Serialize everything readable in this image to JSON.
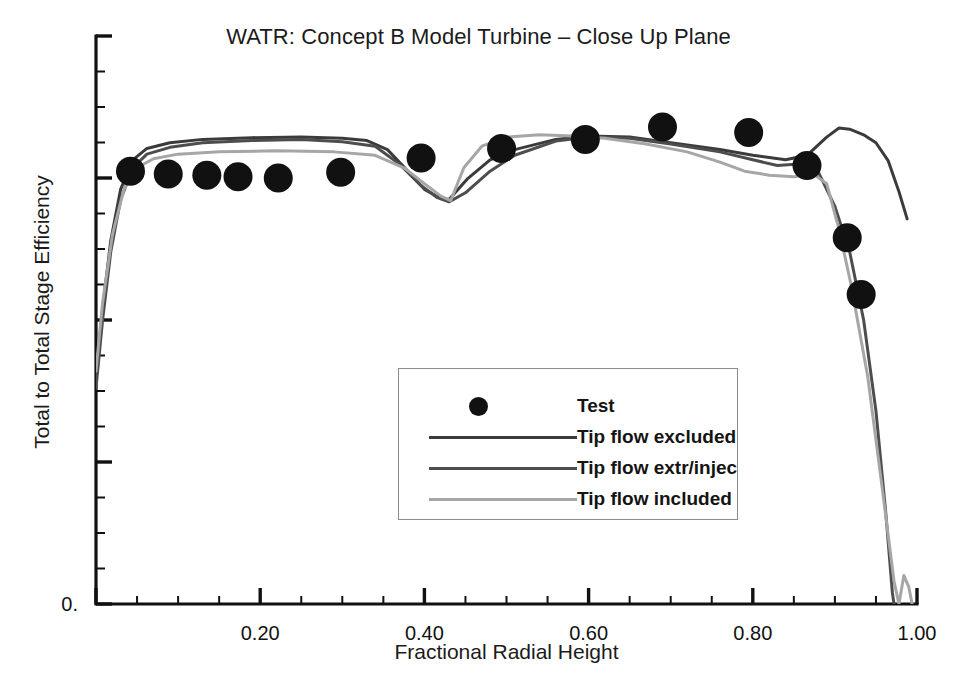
{
  "chart_data": {
    "type": "line",
    "title": "WATR: Concept B Model Turbine – Close Up Plane",
    "xlabel": "Fractional Radial Height",
    "ylabel": "Total to Total Stage Efficiency",
    "xlim": [
      0.0,
      1.0
    ],
    "ylim": [
      0.0,
      1.0
    ],
    "grid": false,
    "legend_position": "center",
    "xticks": [
      0.0,
      0.2,
      0.4,
      0.6,
      0.8,
      1.0
    ],
    "xtick_labels": [
      "",
      "0.20",
      "0.40",
      "0.60",
      "0.80",
      "1.00"
    ],
    "xminor_step": 0.05,
    "yticks": [
      0.0,
      0.25,
      0.5,
      0.75,
      1.0
    ],
    "ytick_labels": [
      "0.",
      "",
      "",
      "",
      ""
    ],
    "yminor_step": 0.0625,
    "series": [
      {
        "name": "Test",
        "type": "scatter",
        "marker": "circle",
        "color": "#111111",
        "points": [
          {
            "x": 0.042,
            "y": 0.762
          },
          {
            "x": 0.088,
            "y": 0.757
          },
          {
            "x": 0.135,
            "y": 0.755
          },
          {
            "x": 0.173,
            "y": 0.752
          },
          {
            "x": 0.222,
            "y": 0.75
          },
          {
            "x": 0.298,
            "y": 0.76
          },
          {
            "x": 0.396,
            "y": 0.785
          },
          {
            "x": 0.494,
            "y": 0.802
          },
          {
            "x": 0.596,
            "y": 0.818
          },
          {
            "x": 0.69,
            "y": 0.84
          },
          {
            "x": 0.795,
            "y": 0.83
          },
          {
            "x": 0.866,
            "y": 0.772
          },
          {
            "x": 0.915,
            "y": 0.645
          },
          {
            "x": 0.932,
            "y": 0.545
          }
        ]
      },
      {
        "name": "Tip flow excluded",
        "type": "line",
        "color": "#3b3b3b",
        "width": 3.0,
        "points": [
          {
            "x": 0.0,
            "y": 0.4
          },
          {
            "x": 0.008,
            "y": 0.52
          },
          {
            "x": 0.018,
            "y": 0.64
          },
          {
            "x": 0.03,
            "y": 0.73
          },
          {
            "x": 0.045,
            "y": 0.782
          },
          {
            "x": 0.062,
            "y": 0.802
          },
          {
            "x": 0.09,
            "y": 0.812
          },
          {
            "x": 0.13,
            "y": 0.818
          },
          {
            "x": 0.19,
            "y": 0.821
          },
          {
            "x": 0.25,
            "y": 0.822
          },
          {
            "x": 0.3,
            "y": 0.82
          },
          {
            "x": 0.33,
            "y": 0.816
          },
          {
            "x": 0.355,
            "y": 0.8
          },
          {
            "x": 0.38,
            "y": 0.762
          },
          {
            "x": 0.4,
            "y": 0.73
          },
          {
            "x": 0.42,
            "y": 0.714
          },
          {
            "x": 0.43,
            "y": 0.712
          },
          {
            "x": 0.452,
            "y": 0.748
          },
          {
            "x": 0.48,
            "y": 0.782
          },
          {
            "x": 0.51,
            "y": 0.8
          },
          {
            "x": 0.56,
            "y": 0.818
          },
          {
            "x": 0.6,
            "y": 0.824
          },
          {
            "x": 0.65,
            "y": 0.822
          },
          {
            "x": 0.7,
            "y": 0.812
          },
          {
            "x": 0.76,
            "y": 0.8
          },
          {
            "x": 0.8,
            "y": 0.79
          },
          {
            "x": 0.84,
            "y": 0.782
          },
          {
            "x": 0.866,
            "y": 0.79
          },
          {
            "x": 0.89,
            "y": 0.822
          },
          {
            "x": 0.905,
            "y": 0.838
          },
          {
            "x": 0.918,
            "y": 0.836
          },
          {
            "x": 0.935,
            "y": 0.826
          },
          {
            "x": 0.95,
            "y": 0.812
          },
          {
            "x": 0.965,
            "y": 0.78
          },
          {
            "x": 0.978,
            "y": 0.726
          },
          {
            "x": 0.988,
            "y": 0.678
          }
        ]
      },
      {
        "name": "Tip flow extr/injec",
        "type": "line",
        "color": "#4d4d4d",
        "width": 3.0,
        "points": [
          {
            "x": 0.0,
            "y": 0.38
          },
          {
            "x": 0.008,
            "y": 0.5
          },
          {
            "x": 0.018,
            "y": 0.62
          },
          {
            "x": 0.03,
            "y": 0.712
          },
          {
            "x": 0.045,
            "y": 0.768
          },
          {
            "x": 0.062,
            "y": 0.792
          },
          {
            "x": 0.09,
            "y": 0.804
          },
          {
            "x": 0.13,
            "y": 0.812
          },
          {
            "x": 0.19,
            "y": 0.816
          },
          {
            "x": 0.25,
            "y": 0.818
          },
          {
            "x": 0.3,
            "y": 0.814
          },
          {
            "x": 0.34,
            "y": 0.806
          },
          {
            "x": 0.37,
            "y": 0.774
          },
          {
            "x": 0.395,
            "y": 0.738
          },
          {
            "x": 0.415,
            "y": 0.716
          },
          {
            "x": 0.43,
            "y": 0.708
          },
          {
            "x": 0.45,
            "y": 0.724
          },
          {
            "x": 0.48,
            "y": 0.762
          },
          {
            "x": 0.51,
            "y": 0.79
          },
          {
            "x": 0.56,
            "y": 0.815
          },
          {
            "x": 0.6,
            "y": 0.822
          },
          {
            "x": 0.65,
            "y": 0.82
          },
          {
            "x": 0.7,
            "y": 0.81
          },
          {
            "x": 0.76,
            "y": 0.796
          },
          {
            "x": 0.8,
            "y": 0.782
          },
          {
            "x": 0.83,
            "y": 0.772
          },
          {
            "x": 0.86,
            "y": 0.775
          },
          {
            "x": 0.88,
            "y": 0.76
          },
          {
            "x": 0.9,
            "y": 0.7
          },
          {
            "x": 0.918,
            "y": 0.62
          },
          {
            "x": 0.935,
            "y": 0.5
          },
          {
            "x": 0.95,
            "y": 0.34
          },
          {
            "x": 0.962,
            "y": 0.16
          },
          {
            "x": 0.97,
            "y": 0.02
          },
          {
            "x": 0.972,
            "y": 0.0
          }
        ]
      },
      {
        "name": "Tip flow included",
        "type": "line",
        "color": "#a6a6a6",
        "width": 3.0,
        "points": [
          {
            "x": 0.0,
            "y": 0.41
          },
          {
            "x": 0.008,
            "y": 0.53
          },
          {
            "x": 0.02,
            "y": 0.65
          },
          {
            "x": 0.034,
            "y": 0.73
          },
          {
            "x": 0.05,
            "y": 0.768
          },
          {
            "x": 0.07,
            "y": 0.784
          },
          {
            "x": 0.1,
            "y": 0.792
          },
          {
            "x": 0.15,
            "y": 0.796
          },
          {
            "x": 0.22,
            "y": 0.798
          },
          {
            "x": 0.29,
            "y": 0.796
          },
          {
            "x": 0.34,
            "y": 0.79
          },
          {
            "x": 0.375,
            "y": 0.768
          },
          {
            "x": 0.4,
            "y": 0.74
          },
          {
            "x": 0.42,
            "y": 0.718
          },
          {
            "x": 0.432,
            "y": 0.71
          },
          {
            "x": 0.448,
            "y": 0.768
          },
          {
            "x": 0.47,
            "y": 0.806
          },
          {
            "x": 0.5,
            "y": 0.822
          },
          {
            "x": 0.54,
            "y": 0.826
          },
          {
            "x": 0.58,
            "y": 0.824
          },
          {
            "x": 0.62,
            "y": 0.82
          },
          {
            "x": 0.67,
            "y": 0.81
          },
          {
            "x": 0.72,
            "y": 0.796
          },
          {
            "x": 0.76,
            "y": 0.778
          },
          {
            "x": 0.79,
            "y": 0.762
          },
          {
            "x": 0.82,
            "y": 0.755
          },
          {
            "x": 0.85,
            "y": 0.752
          },
          {
            "x": 0.875,
            "y": 0.756
          },
          {
            "x": 0.89,
            "y": 0.74
          },
          {
            "x": 0.905,
            "y": 0.66
          },
          {
            "x": 0.92,
            "y": 0.56
          },
          {
            "x": 0.94,
            "y": 0.4
          },
          {
            "x": 0.958,
            "y": 0.2
          },
          {
            "x": 0.972,
            "y": 0.04
          },
          {
            "x": 0.978,
            "y": 0.0
          },
          {
            "x": 0.984,
            "y": 0.05
          },
          {
            "x": 0.99,
            "y": 0.03
          },
          {
            "x": 0.994,
            "y": 0.0
          }
        ]
      }
    ],
    "legend": [
      {
        "label": "Test",
        "symbol": "dot",
        "color": "#111111"
      },
      {
        "label": "Tip flow excluded",
        "symbol": "line",
        "color": "#3b3b3b"
      },
      {
        "label": "Tip flow extr/injec",
        "symbol": "line",
        "color": "#4d4d4d"
      },
      {
        "label": "Tip flow included",
        "symbol": "line",
        "color": "#a6a6a6"
      }
    ]
  }
}
